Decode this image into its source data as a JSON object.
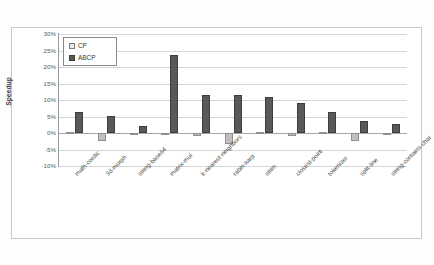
{
  "chart_data": {
    "type": "bar",
    "title": "",
    "xlabel": "",
    "ylabel": "Speedup",
    "ylim": [
      -10,
      30
    ],
    "ytick_labels": [
      "30%",
      "25%",
      "20%",
      "15%",
      "10%",
      "5%",
      "0%",
      "-5%",
      "-10%"
    ],
    "ytick_values": [
      30,
      25,
      20,
      15,
      10,
      5,
      0,
      -5,
      -10
    ],
    "grid": true,
    "legend_position": "top-left",
    "categories": [
      "math-cordic",
      "3d-morph",
      "string-base64",
      "matrix-mul",
      "k-nearest-neighbors",
      "rabin-karp",
      "strim",
      "closest-point",
      "tokenizer",
      "split-line",
      "string-contains-char"
    ],
    "series": [
      {
        "name": "CP",
        "color": "#bfbfbf",
        "values": [
          0.2,
          -2.4,
          -0.6,
          -0.7,
          -0.8,
          -3.3,
          0.4,
          -0.9,
          0.3,
          -2.5,
          -0.4
        ]
      },
      {
        "name": "ABCP",
        "color": "#595959",
        "values": [
          6.3,
          5.2,
          2.1,
          23.7,
          11.6,
          11.4,
          10.8,
          9.2,
          6.5,
          3.6,
          2.7
        ]
      }
    ]
  },
  "legend": {
    "items": [
      {
        "label": "CP"
      },
      {
        "label": "ABCP"
      }
    ]
  },
  "axis": {
    "y_title": "Speedup"
  }
}
